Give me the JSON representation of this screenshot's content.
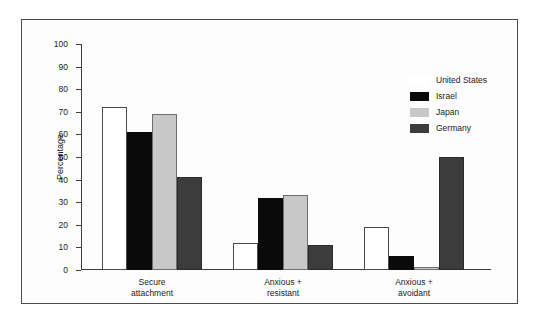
{
  "chart_data": {
    "type": "bar",
    "title": "",
    "xlabel": "",
    "ylabel": "Percentage",
    "ylim": [
      0,
      100
    ],
    "yticks": [
      0,
      10,
      20,
      30,
      40,
      50,
      60,
      70,
      80,
      90,
      100
    ],
    "ytick_labels": [
      "0",
      "10",
      "20",
      "30",
      "40",
      "50",
      "60",
      "70",
      "80",
      "90",
      "100"
    ],
    "grid": false,
    "legend_position": "top-right",
    "categories": [
      "Secure attachment",
      "Anxious + resistant",
      "Anxious + avoidant"
    ],
    "category_lines": [
      [
        "Secure",
        "attachment"
      ],
      [
        "Anxious +",
        "resistant"
      ],
      [
        "Anxious +",
        "avoidant"
      ]
    ],
    "series": [
      {
        "name": "United States",
        "color": "#ffffff",
        "values": [
          72,
          12,
          19
        ]
      },
      {
        "name": "Israel",
        "color": "#0a0a0a",
        "values": [
          61,
          32,
          6
        ]
      },
      {
        "name": "Japan",
        "color": "#c8c8c8",
        "values": [
          69,
          33,
          1.5
        ]
      },
      {
        "name": "Germany",
        "color": "#3c3c3c",
        "values": [
          41,
          11,
          50
        ]
      }
    ]
  },
  "legend": {
    "entries": [
      {
        "label": "United States"
      },
      {
        "label": "Israel"
      },
      {
        "label": "Japan"
      },
      {
        "label": "Germany"
      }
    ]
  },
  "colors": {
    "frame": "#4c4c4c",
    "axis": "#3d3d3d",
    "series_united_states": "#ffffff",
    "series_israel": "#0a0a0a",
    "series_japan": "#c8c8c8",
    "series_germany": "#3c3c3c"
  }
}
